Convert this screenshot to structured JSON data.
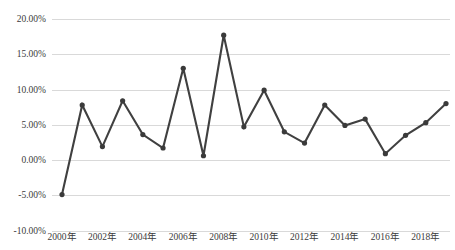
{
  "chart_data": {
    "type": "line",
    "title": "",
    "xlabel": "",
    "ylabel": "",
    "grid": true,
    "legend": false,
    "ylim": [
      -10,
      20
    ],
    "ytick_values": [
      20,
      15,
      10,
      5,
      0,
      -5,
      -10
    ],
    "ytick_labels": [
      "20.00%",
      "15.00%",
      "10.00%",
      "5.00%",
      "0.00%",
      "-5.00%",
      "-10.00%"
    ],
    "xtick_labels": [
      "2000年",
      "2002年",
      "2004年",
      "2006年",
      "2008年",
      "2010年",
      "2012年",
      "2014年",
      "2016年",
      "2018年"
    ],
    "xtick_indices": [
      0,
      2,
      4,
      6,
      8,
      10,
      12,
      14,
      16,
      18
    ],
    "categories": [
      "2000年",
      "2001年",
      "2002年",
      "2003年",
      "2004年",
      "2005年",
      "2006年",
      "2007年",
      "2008年",
      "2009年",
      "2010年",
      "2011年",
      "2012年",
      "2013年",
      "2014年",
      "2015年",
      "2016年",
      "2017年",
      "2018年",
      "2019年"
    ],
    "values": [
      -4.9,
      7.8,
      1.9,
      8.4,
      3.6,
      1.7,
      13.0,
      0.6,
      17.7,
      4.7,
      9.9,
      4.0,
      2.4,
      7.8,
      4.9,
      5.8,
      0.9,
      3.5,
      5.3,
      8.0
    ],
    "value_labels": [
      "-4.90%",
      "7.80%",
      "1.90%",
      "8.40%",
      "3.60%",
      "1.70%",
      "13.00%",
      "0.60%",
      "17.70%",
      "4.70%",
      "9.90%",
      "4.00%",
      "2.40%",
      "7.80%",
      "4.90%",
      "5.80%",
      "0.90%",
      "3.50%",
      "5.30%",
      "8.00%"
    ],
    "colors": {
      "line": "#404040",
      "marker": "#3a3a3a",
      "grid": "#d9d9d9",
      "text": "#3b3b3b",
      "background": "#ffffff"
    }
  }
}
